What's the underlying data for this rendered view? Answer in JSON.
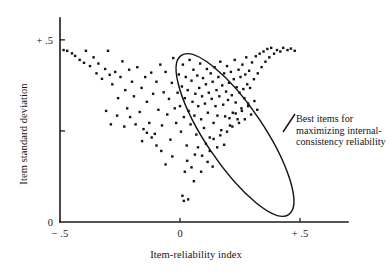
{
  "chart_data": {
    "type": "scatter",
    "title": "",
    "xlabel": "Item-reliability index",
    "ylabel": "Item standard deviation",
    "xlim": [
      -0.5,
      0.7
    ],
    "ylim": [
      0,
      0.56
    ],
    "grid": false,
    "legend": "none",
    "x_ticks": [
      {
        "value": -0.5,
        "label": "− .5"
      },
      {
        "value": 0,
        "label": "0"
      },
      {
        "value": 0.5,
        "label": "+ .5"
      }
    ],
    "y_ticks": [
      {
        "value": 0,
        "label": "0"
      },
      {
        "value": 0.25,
        "label": ""
      },
      {
        "value": 0.5,
        "label": "+ .5"
      }
    ],
    "annotations": [
      {
        "name": "best-items-callout",
        "text_lines": [
          "Best items for",
          "maximizing internal-",
          "consistency reliability"
        ],
        "shape": "ellipse",
        "ellipse": {
          "cx": 0.23,
          "cy": 0.255,
          "rx": 0.055,
          "ry": 0.3,
          "rotation_deg": -34
        }
      }
    ],
    "points": [
      [
        -0.485,
        0.472
      ],
      [
        -0.47,
        0.47
      ],
      [
        -0.45,
        0.463
      ],
      [
        -0.437,
        0.456
      ],
      [
        -0.418,
        0.445
      ],
      [
        -0.4,
        0.437
      ],
      [
        -0.392,
        0.47
      ],
      [
        -0.375,
        0.428
      ],
      [
        -0.36,
        0.452
      ],
      [
        -0.348,
        0.408
      ],
      [
        -0.34,
        0.435
      ],
      [
        -0.325,
        0.393
      ],
      [
        -0.312,
        0.42
      ],
      [
        -0.3,
        0.47
      ],
      [
        -0.293,
        0.404
      ],
      [
        -0.282,
        0.378
      ],
      [
        -0.27,
        0.412
      ],
      [
        -0.258,
        0.34
      ],
      [
        -0.248,
        0.398
      ],
      [
        -0.24,
        0.441
      ],
      [
        -0.228,
        0.362
      ],
      [
        -0.22,
        0.312
      ],
      [
        -0.212,
        0.418
      ],
      [
        -0.2,
        0.385
      ],
      [
        -0.192,
        0.345
      ],
      [
        -0.185,
        0.268
      ],
      [
        -0.178,
        0.425
      ],
      [
        -0.168,
        0.302
      ],
      [
        -0.16,
        0.368
      ],
      [
        -0.152,
        0.255
      ],
      [
        -0.145,
        0.398
      ],
      [
        -0.138,
        0.33
      ],
      [
        -0.128,
        0.272
      ],
      [
        -0.12,
        0.41
      ],
      [
        -0.112,
        0.352
      ],
      [
        -0.105,
        0.242
      ],
      [
        -0.098,
        0.385
      ],
      [
        -0.09,
        0.308
      ],
      [
        -0.082,
        0.432
      ],
      [
        -0.075,
        0.265
      ],
      [
        -0.068,
        0.356
      ],
      [
        -0.06,
        0.412
      ],
      [
        -0.053,
        0.295
      ],
      [
        -0.046,
        0.338
      ],
      [
        -0.04,
        0.226
      ],
      [
        -0.034,
        0.382
      ],
      [
        -0.028,
        0.45
      ],
      [
        -0.022,
        0.312
      ],
      [
        -0.016,
        0.272
      ],
      [
        -0.01,
        0.355
      ],
      [
        -0.005,
        0.405
      ],
      [
        0.0,
        0.318
      ],
      [
        0.004,
        0.248
      ],
      [
        0.008,
        0.372
      ],
      [
        0.012,
        0.432
      ],
      [
        0.016,
        0.288
      ],
      [
        0.02,
        0.34
      ],
      [
        0.024,
        0.398
      ],
      [
        0.028,
        0.21
      ],
      [
        0.032,
        0.362
      ],
      [
        0.036,
        0.305
      ],
      [
        0.04,
        0.445
      ],
      [
        0.044,
        0.268
      ],
      [
        0.048,
        0.388
      ],
      [
        0.052,
        0.33
      ],
      [
        0.056,
        0.418
      ],
      [
        0.06,
        0.292
      ],
      [
        0.064,
        0.352
      ],
      [
        0.068,
        0.24
      ],
      [
        0.072,
        0.402
      ],
      [
        0.076,
        0.318
      ],
      [
        0.08,
        0.368
      ],
      [
        0.084,
        0.435
      ],
      [
        0.088,
        0.282
      ],
      [
        0.092,
        0.345
      ],
      [
        0.096,
        0.395
      ],
      [
        0.1,
        0.258
      ],
      [
        0.104,
        0.325
      ],
      [
        0.108,
        0.378
      ],
      [
        0.112,
        0.42
      ],
      [
        0.116,
        0.3
      ],
      [
        0.12,
        0.355
      ],
      [
        0.124,
        0.232
      ],
      [
        0.128,
        0.408
      ],
      [
        0.132,
        0.338
      ],
      [
        0.136,
        0.385
      ],
      [
        0.14,
        0.272
      ],
      [
        0.144,
        0.425
      ],
      [
        0.148,
        0.318
      ],
      [
        0.152,
        0.362
      ],
      [
        0.156,
        0.292
      ],
      [
        0.16,
        0.398
      ],
      [
        0.164,
        0.345
      ],
      [
        0.168,
        0.44
      ],
      [
        0.172,
        0.252
      ],
      [
        0.176,
        0.375
      ],
      [
        0.18,
        0.322
      ],
      [
        0.184,
        0.408
      ],
      [
        0.188,
        0.29
      ],
      [
        0.192,
        0.358
      ],
      [
        0.196,
        0.428
      ],
      [
        0.2,
        0.335
      ],
      [
        0.204,
        0.382
      ],
      [
        0.208,
        0.265
      ],
      [
        0.212,
        0.412
      ],
      [
        0.216,
        0.348
      ],
      [
        0.22,
        0.3
      ],
      [
        0.224,
        0.392
      ],
      [
        0.228,
        0.445
      ],
      [
        0.232,
        0.328
      ],
      [
        0.236,
        0.37
      ],
      [
        0.24,
        0.282
      ],
      [
        0.244,
        0.418
      ],
      [
        0.248,
        0.355
      ],
      [
        0.252,
        0.398
      ],
      [
        0.256,
        0.312
      ],
      [
        0.26,
        0.432
      ],
      [
        0.264,
        0.365
      ],
      [
        0.268,
        0.34
      ],
      [
        0.272,
        0.405
      ],
      [
        0.276,
        0.452
      ],
      [
        0.28,
        0.378
      ],
      [
        0.284,
        0.325
      ],
      [
        0.288,
        0.415
      ],
      [
        0.292,
        0.368
      ],
      [
        0.3,
        0.438
      ],
      [
        0.308,
        0.392
      ],
      [
        0.316,
        0.455
      ],
      [
        0.324,
        0.408
      ],
      [
        0.332,
        0.462
      ],
      [
        0.34,
        0.425
      ],
      [
        0.348,
        0.468
      ],
      [
        0.356,
        0.44
      ],
      [
        0.364,
        0.475
      ],
      [
        0.372,
        0.452
      ],
      [
        0.38,
        0.478
      ],
      [
        0.392,
        0.462
      ],
      [
        0.404,
        0.472
      ],
      [
        0.418,
        0.468
      ],
      [
        0.43,
        0.478
      ],
      [
        0.448,
        0.472
      ],
      [
        0.462,
        0.476
      ],
      [
        0.478,
        0.47
      ],
      [
        0.03,
        0.168
      ],
      [
        0.048,
        0.15
      ],
      [
        0.062,
        0.185
      ],
      [
        0.02,
        0.138
      ],
      [
        0.01,
        0.072
      ],
      [
        0.016,
        0.058
      ],
      [
        0.034,
        0.062
      ],
      [
        -0.06,
        0.158
      ],
      [
        -0.032,
        0.18
      ],
      [
        0.075,
        0.205
      ],
      [
        0.092,
        0.182
      ],
      [
        0.108,
        0.215
      ],
      [
        0.124,
        0.195
      ],
      [
        0.14,
        0.228
      ],
      [
        0.155,
        0.205
      ],
      [
        0.168,
        0.238
      ],
      [
        0.184,
        0.212
      ],
      [
        0.196,
        0.248
      ],
      [
        0.115,
        0.165
      ],
      [
        0.136,
        0.152
      ],
      [
        0.088,
        0.138
      ],
      [
        0.058,
        0.112
      ],
      [
        0.206,
        0.285
      ],
      [
        0.218,
        0.262
      ],
      [
        0.232,
        0.298
      ],
      [
        0.246,
        0.272
      ],
      [
        0.258,
        0.305
      ],
      [
        0.27,
        0.282
      ],
      [
        0.284,
        0.318
      ],
      [
        0.296,
        0.295
      ],
      [
        0.31,
        0.332
      ],
      [
        0.322,
        0.308
      ],
      [
        -0.098,
        0.21
      ],
      [
        -0.118,
        0.232
      ],
      [
        -0.078,
        0.195
      ],
      [
        -0.138,
        0.245
      ],
      [
        -0.158,
        0.222
      ],
      [
        -0.208,
        0.288
      ],
      [
        -0.232,
        0.262
      ],
      [
        -0.262,
        0.292
      ],
      [
        -0.288,
        0.268
      ],
      [
        -0.308,
        0.305
      ]
    ]
  }
}
